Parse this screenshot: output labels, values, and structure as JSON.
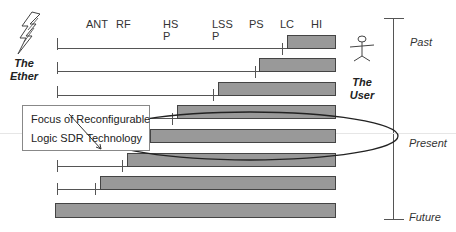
{
  "columns": [
    {
      "label": "ANT",
      "x": 85
    },
    {
      "label": "RF",
      "x": 115
    },
    {
      "label": "HS\nP",
      "x": 163
    },
    {
      "label": "LSS\nP",
      "x": 212
    },
    {
      "label": "PS",
      "x": 249
    },
    {
      "label": "LC",
      "x": 280
    },
    {
      "label": "HI",
      "x": 310
    }
  ],
  "col_labels": {
    "ant": "ANT",
    "rf": "RF",
    "hsp_1": "HS",
    "hsp_2": "P",
    "lssp_1": "LSS",
    "lssp_2": "P",
    "ps": "PS",
    "lc": "LC",
    "hi": "HI"
  },
  "actors": {
    "ether_1": "The",
    "ether_2": "Ether",
    "user_1": "The",
    "user_2": "User"
  },
  "timeline": {
    "past": "Past",
    "present": "Present",
    "future": "Future"
  },
  "callout": {
    "line1": "Focus of Reconfigurable",
    "line2": "Logic SDR Technology"
  },
  "rows": [
    {
      "line_start": 57,
      "tick_x": 282,
      "bar_start": 287,
      "bar_end": 336,
      "y": 35
    },
    {
      "line_start": 57,
      "tick_x": 255,
      "bar_start": 259,
      "bar_end": 336,
      "y": 58
    },
    {
      "line_start": 57,
      "tick_x": 213,
      "bar_start": 218,
      "bar_end": 336,
      "y": 82
    },
    {
      "line_start": 57,
      "tick_x": 172,
      "bar_start": 177,
      "bar_end": 336,
      "y": 105
    },
    {
      "line_start": 57,
      "tick_x": 150,
      "bar_start": 150,
      "bar_end": 336,
      "y": 129
    },
    {
      "line_start": 57,
      "tick_x": 122,
      "bar_start": 127,
      "bar_end": 336,
      "y": 153
    },
    {
      "line_start": 57,
      "tick_x": 95,
      "bar_start": 100,
      "bar_end": 336,
      "y": 176
    },
    {
      "line_start": 55,
      "tick_x": null,
      "bar_start": 55,
      "bar_end": 336,
      "y": 203
    }
  ],
  "colors": {
    "bar": "#999999",
    "bar_border": "#444444",
    "line": "#555555"
  }
}
